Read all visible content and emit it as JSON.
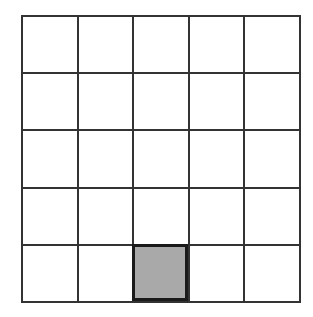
{
  "board": {
    "rows": 5,
    "cols": 5,
    "line_color": "#333333",
    "cell_color": "#ffffff",
    "selected": {
      "row": 4,
      "col": 2
    },
    "selected_fill": "#a9a9a9",
    "selected_border": "#1a1a1a"
  }
}
